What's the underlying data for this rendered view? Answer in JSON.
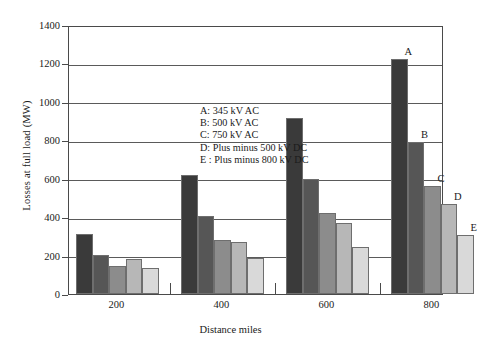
{
  "chart_data": {
    "type": "bar",
    "title": "",
    "xlabel": "Distance miles",
    "ylabel": "Losses at full load (MW)",
    "categories": [
      "200",
      "400",
      "600",
      "800"
    ],
    "ylim": [
      0,
      1400
    ],
    "yticks": [
      "0",
      "200",
      "400",
      "600",
      "800",
      "1000",
      "1200",
      "1400"
    ],
    "grid": true,
    "legend_position": "inside-upper-left",
    "series": [
      {
        "key": "A",
        "name": "A: 345 kV AC",
        "color": "#3a3a3a",
        "values": [
          310,
          620,
          915,
          1225
        ]
      },
      {
        "key": "B",
        "name": "B: 500 kV AC",
        "color": "#565656",
        "values": [
          205,
          405,
          600,
          790
        ]
      },
      {
        "key": "C",
        "name": "C: 750 kV AC",
        "color": "#8c8c8c",
        "values": [
          145,
          280,
          420,
          560
        ]
      },
      {
        "key": "D",
        "name": "D: Plus minus 500 kV DC",
        "color": "#b7b7b7",
        "values": [
          180,
          270,
          370,
          470
        ]
      },
      {
        "key": "E",
        "name": "E : Plus minus 800 kV DC",
        "color": "#d9d9d9",
        "values": [
          135,
          190,
          245,
          305
        ]
      }
    ],
    "annotations": [
      {
        "text": "A",
        "group": "800",
        "series": "A"
      },
      {
        "text": "B",
        "group": "800",
        "series": "B"
      },
      {
        "text": "C",
        "group": "800",
        "series": "C"
      },
      {
        "text": "D",
        "group": "800",
        "series": "D"
      },
      {
        "text": "E",
        "group": "800",
        "series": "E"
      }
    ]
  },
  "legend": {
    "lines": [
      "A: 345 kV AC",
      "B: 500 kV AC",
      "C: 750 kV AC",
      "D: Plus minus 500 kV DC",
      "E : Plus minus 800 kV DC"
    ]
  }
}
